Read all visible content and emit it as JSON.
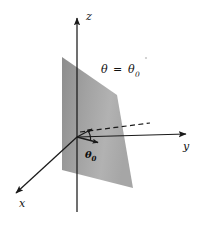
{
  "figure": {
    "title_text": "",
    "background_color": "#ffffff",
    "ink_color": "#1a1a1a",
    "plane_fill_light": "#b4b4b4",
    "plane_fill_dark": "#8f8f8f",
    "labels": {
      "z_axis": "z",
      "y_axis": "y",
      "x_axis": "x",
      "plane_theta_symbol": "θ",
      "plane_equals": "=",
      "plane_theta_value": "θ",
      "plane_theta_value_sub": "0",
      "angle_symbol": "θ",
      "angle_sub": "0"
    },
    "plane_equation": "θ = θ0",
    "geometry": {
      "origin": [
        77,
        137
      ],
      "z_tip": [
        77,
        14
      ],
      "z_base": [
        77,
        212
      ],
      "y_tip": [
        189,
        134
      ],
      "x_tip": [
        14,
        196
      ],
      "dashed_tip": [
        152,
        123
      ],
      "radial_arrow_tip": [
        101,
        143
      ],
      "plane_corners": [
        [
          62,
          57
        ],
        [
          117,
          95
        ],
        [
          133,
          188
        ],
        [
          62,
          170
        ]
      ]
    }
  }
}
